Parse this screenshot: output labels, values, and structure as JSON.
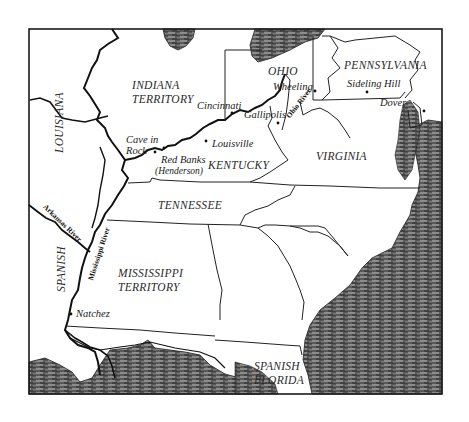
{
  "map": {
    "frame_color": "#1a1a1a",
    "water_color": "#4a4a4a",
    "land_color": "#ffffff",
    "regions": {
      "indiana_territory": [
        "INDIANA",
        "TERRITORY"
      ],
      "ohio": "OHIO",
      "pennsylvania": "PENNSYLVANIA",
      "louisiana": "LOUISIANA",
      "kentucky": "KENTUCKY",
      "virginia": "VIRGINIA",
      "tennessee": "TENNESSEE",
      "spanish": "SPANISH",
      "mississippi_territory": [
        "MISSISSIPPI",
        "TERRITORY"
      ],
      "spanish_florida": [
        "SPANISH",
        "FLORIDA"
      ]
    },
    "places": {
      "cincinnati": "Cincinnati",
      "gallipolis": "Gallipolis",
      "wheeling": "Wheeling",
      "sideling_hill": "Sideling Hill",
      "dover": "Dover",
      "cave_in_rock": [
        "Cave in",
        "Rock"
      ],
      "louisville": "Louisville",
      "red_banks": [
        "Red Banks",
        "(Henderson)"
      ],
      "natchez": "Natchez"
    },
    "rivers": {
      "ohio_river": "Ohio River",
      "arkansas_river": "Arkansas River",
      "mississippi_river": "Mississippi River"
    }
  }
}
